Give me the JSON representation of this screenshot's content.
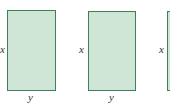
{
  "figure": {
    "rectangles": [
      {
        "side_label": "x",
        "bottom_label": "y"
      },
      {
        "side_label": "x",
        "bottom_label": "y"
      },
      {
        "side_label": "x",
        "bottom_label": ""
      }
    ],
    "colors": {
      "fill": "#cfe6d6",
      "stroke": "#3f7f5a"
    }
  }
}
